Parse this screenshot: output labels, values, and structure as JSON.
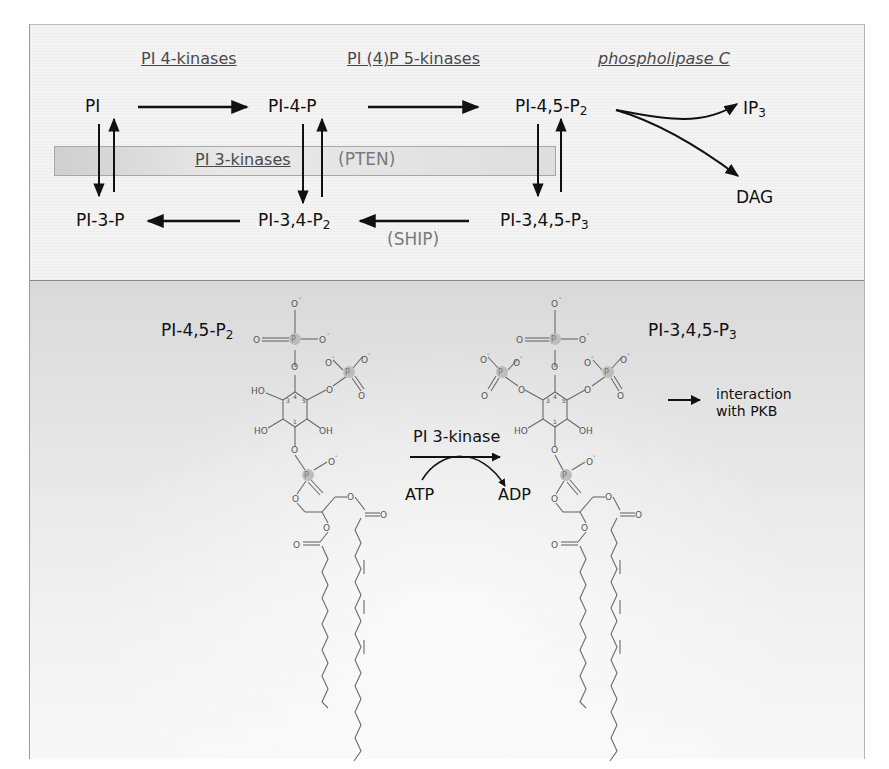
{
  "figure": {
    "top_panel": {
      "enzymes": {
        "pi4k": "PI 4-kinases",
        "pip5k": "PI (4)P 5-kinases",
        "plc": "phospholipase C",
        "pi3k": "PI 3-kinases",
        "pten": "(PTEN)",
        "ship": "(SHIP)"
      },
      "metabolites": {
        "pi": "PI",
        "pi4p": "PI-4-P",
        "pi45p2_base": "PI-4,5-P",
        "pi45p2_sub": "2",
        "ip3_base": "IP",
        "ip3_sub": "3",
        "dag": "DAG",
        "pi3p": "PI-3-P",
        "pi34p2_base": "PI-3,4-P",
        "pi34p2_sub": "2",
        "pip3_base": "PI-3,4,5-P",
        "pip3_sub": "3"
      }
    },
    "bottom_panel": {
      "left_molecule": {
        "name_base": "PI-4,5-P",
        "name_sub": "2"
      },
      "right_molecule": {
        "name_base": "PI-3,4,5-P",
        "name_sub": "3"
      },
      "reaction": {
        "enzyme": "PI 3-kinase",
        "substrate": "ATP",
        "product": "ADP"
      },
      "effect": {
        "line1": "interaction",
        "line2": "with PKB"
      },
      "atom_labels": {
        "ho": "HO",
        "oh": "OH",
        "o": "O",
        "o_minus": "O",
        "minus": "-",
        "p": "P",
        "ring_3": "3",
        "ring_4": "4",
        "ring_5": "5",
        "ring_1": "1"
      }
    },
    "colors": {
      "top_bg": "#f4f4f4",
      "bottom_bg_top": "#d9d9d9",
      "bottom_bg_bottom": "#f8f8f8",
      "enzyme_text": "#4a4a4a",
      "regulator_text": "#7a7a7a",
      "phosphorus_highlight": "#b9b9b9"
    }
  }
}
